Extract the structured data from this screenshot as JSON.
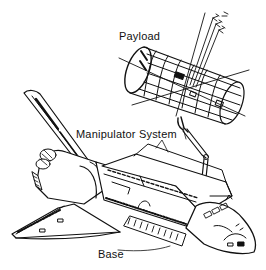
{
  "diagram": {
    "labels": {
      "payload": "Payload",
      "manipulator": "Manipulator System",
      "base": "Base"
    },
    "components": [
      "payload-cylinder",
      "payload-coordinate-axes",
      "manipulator-arm",
      "orbiter-base"
    ],
    "colors": {
      "line": "#111111",
      "background": "#ffffff"
    }
  }
}
